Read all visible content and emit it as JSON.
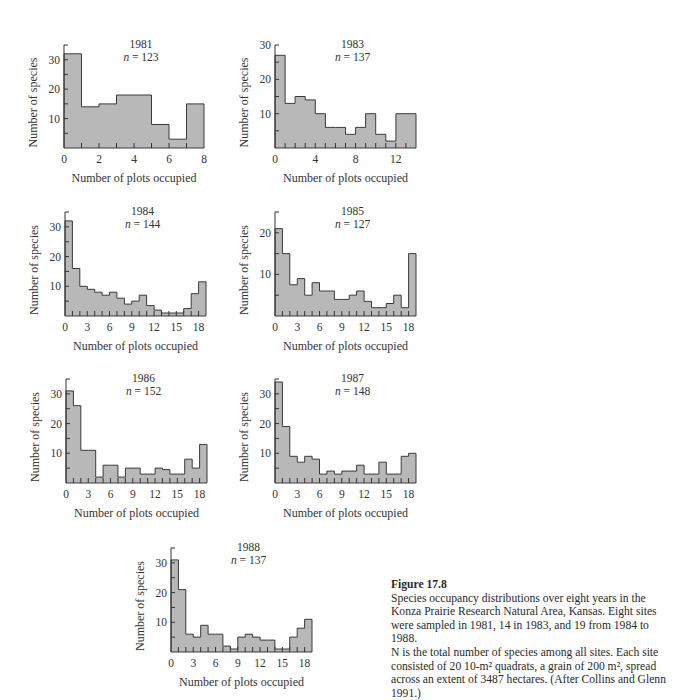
{
  "figure": {
    "label": "Figure 17.8",
    "caption_lines": [
      "Species occupancy distributions over eight years in the",
      "Konza Prairie Research Natural Area, Kansas. Eight sites",
      "were sampled in 1981, 14 in 1983, and 19 from 1984 to 1988.",
      "N is the total number of species among all sites. Each site",
      "consisted of 20 10-m² quadrats, a grain of 200 m², spread",
      "across an extent of 3487 hectares. (After Collins and Glenn",
      "1991.)"
    ]
  },
  "style": {
    "bar_fill": "#b8b8b8",
    "bar_stroke": "#3a3a3a",
    "axis_color": "#333333"
  },
  "chart_data": [
    {
      "type": "bar",
      "title": "1981",
      "subtitle": "n = 123",
      "xlabel": "Number of plots occupied",
      "ylabel": "Number of species",
      "x_ticks": [
        0,
        2,
        4,
        6,
        8
      ],
      "y_ticks": [
        10,
        20,
        30
      ],
      "xlim": [
        0,
        8
      ],
      "ylim": [
        0,
        35
      ],
      "bin_edges": [
        0,
        1,
        2,
        3,
        4,
        5,
        6,
        7,
        8
      ],
      "values": [
        32,
        14,
        15,
        18,
        18,
        8,
        3,
        15
      ]
    },
    {
      "type": "bar",
      "title": "1983",
      "subtitle": "n = 137",
      "xlabel": "Number of plots occupied",
      "ylabel": "Number of species",
      "x_ticks": [
        0,
        4,
        8,
        12
      ],
      "y_ticks": [
        10,
        20,
        30
      ],
      "xlim": [
        0,
        14
      ],
      "ylim": [
        0,
        30
      ],
      "bin_edges": [
        0,
        1,
        2,
        3,
        4,
        5,
        6,
        7,
        8,
        9,
        10,
        11,
        12,
        13,
        14
      ],
      "values": [
        27,
        13,
        15,
        14,
        10,
        6,
        6,
        4,
        6,
        10,
        4,
        2,
        10,
        10
      ]
    },
    {
      "type": "bar",
      "title": "1984",
      "subtitle": "n = 144",
      "xlabel": "Number of plots occupied",
      "ylabel": "Number of species",
      "x_ticks": [
        0,
        3,
        6,
        9,
        12,
        15,
        18
      ],
      "y_ticks": [
        10,
        20,
        30
      ],
      "xlim": [
        0,
        19
      ],
      "ylim": [
        0,
        35
      ],
      "values": [
        32,
        16,
        10,
        9,
        8,
        7,
        8,
        6,
        4,
        5,
        7,
        3.5,
        2,
        1,
        1,
        1,
        2.5,
        7.5,
        11.5
      ]
    },
    {
      "type": "bar",
      "title": "1985",
      "subtitle": "n = 127",
      "xlabel": "Number of plots occupied",
      "ylabel": "Number of species",
      "x_ticks": [
        0,
        3,
        6,
        9,
        12,
        15,
        18
      ],
      "y_ticks": [
        10,
        20
      ],
      "xlim": [
        0,
        19
      ],
      "ylim": [
        0,
        25
      ],
      "values": [
        21,
        15,
        7.5,
        9,
        5,
        8,
        6,
        6,
        4,
        4,
        5,
        6,
        3.5,
        2,
        2,
        3,
        5,
        2,
        15
      ]
    },
    {
      "type": "bar",
      "title": "1986",
      "subtitle": "n = 152",
      "xlabel": "Number of plots occupied",
      "ylabel": "Number of species",
      "x_ticks": [
        0,
        3,
        6,
        9,
        12,
        15,
        18
      ],
      "y_ticks": [
        10,
        20,
        30
      ],
      "xlim": [
        0,
        19
      ],
      "ylim": [
        0,
        35
      ],
      "values": [
        31,
        26,
        11,
        11,
        2,
        6,
        6,
        2,
        5,
        5,
        3,
        3,
        5,
        4.5,
        3,
        3,
        8,
        5,
        13
      ]
    },
    {
      "type": "bar",
      "title": "1987",
      "subtitle": "n = 148",
      "xlabel": "Number of plots occupied",
      "ylabel": "Number of species",
      "x_ticks": [
        0,
        3,
        6,
        9,
        12,
        15,
        18
      ],
      "y_ticks": [
        10,
        20,
        30
      ],
      "xlim": [
        0,
        19
      ],
      "ylim": [
        0,
        35
      ],
      "values": [
        34,
        19,
        9,
        7,
        9,
        8,
        3,
        4,
        3,
        4,
        4,
        6,
        3,
        3,
        7,
        3,
        3,
        9,
        10
      ]
    },
    {
      "type": "bar",
      "title": "1988",
      "subtitle": "n = 137",
      "xlabel": "Number of plots occupied",
      "ylabel": "Number of species",
      "x_ticks": [
        0,
        3,
        6,
        9,
        12,
        15,
        18
      ],
      "y_ticks": [
        10,
        20,
        30
      ],
      "xlim": [
        0,
        19
      ],
      "ylim": [
        0,
        35
      ],
      "values": [
        31,
        21,
        6,
        5,
        9,
        6,
        6,
        2,
        1,
        5,
        6,
        5,
        4,
        4,
        1,
        1,
        5,
        8,
        11
      ]
    }
  ],
  "layout": [
    {
      "left": 64,
      "top": 45,
      "width": 140,
      "height": 103,
      "tick_step": 1
    },
    {
      "left": 275,
      "top": 45,
      "width": 141,
      "height": 103,
      "tick_step": 1
    },
    {
      "left": 65,
      "top": 212,
      "width": 141,
      "height": 104,
      "tick_step": 1
    },
    {
      "left": 275,
      "top": 212,
      "width": 141,
      "height": 104,
      "tick_step": 1
    },
    {
      "left": 66,
      "top": 379,
      "width": 141,
      "height": 104,
      "tick_step": 1
    },
    {
      "left": 275,
      "top": 379,
      "width": 141,
      "height": 104,
      "tick_step": 1
    },
    {
      "left": 171,
      "top": 548,
      "width": 141,
      "height": 104,
      "tick_step": 1
    }
  ]
}
